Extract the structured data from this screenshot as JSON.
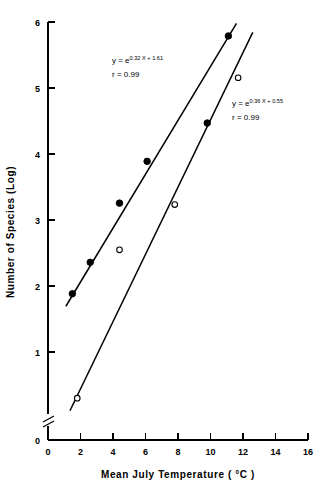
{
  "chart_data": {
    "type": "scatter",
    "title": "",
    "xlabel": "Mean July Temperature ( °C )",
    "ylabel": "Number of Species (Log)",
    "xlim": [
      0,
      16
    ],
    "ylim": [
      0,
      6
    ],
    "x_ticks": [
      0,
      2,
      4,
      6,
      8,
      10,
      12,
      14,
      16
    ],
    "x_tick_labels": [
      "0",
      "2",
      "4",
      "6",
      "8",
      "10",
      "12",
      "14",
      "16"
    ],
    "y_ticks": [
      0,
      1,
      2,
      3,
      4,
      5,
      6
    ],
    "y_tick_labels": [
      "0",
      "1",
      "2",
      "3",
      "4",
      "5",
      "6"
    ],
    "grid": false,
    "legend_position": "none",
    "y_axis_break": {
      "present": true,
      "between": [
        0,
        1
      ],
      "label": "axis-break"
    },
    "series": [
      {
        "name": "filled-circles",
        "marker": "filled-circle",
        "points": [
          {
            "x": 1.5,
            "y": 2.1
          },
          {
            "x": 2.6,
            "y": 2.55
          },
          {
            "x": 4.4,
            "y": 3.4
          },
          {
            "x": 6.1,
            "y": 4.0
          },
          {
            "x": 9.8,
            "y": 4.55
          },
          {
            "x": 11.1,
            "y": 5.8
          }
        ],
        "fit": {
          "equation_html": "y = e",
          "exponent": "0.32 X + 1.61",
          "r_label": "r = 0.99",
          "slope": 0.32,
          "intercept": 1.61,
          "r": 0.99,
          "line_endpoints": [
            {
              "x": 1.1,
              "y": 1.92
            },
            {
              "x": 11.6,
              "y": 5.98
            }
          ]
        }
      },
      {
        "name": "open-circles",
        "marker": "open-circle",
        "points": [
          {
            "x": 1.8,
            "y": 0.6
          },
          {
            "x": 4.4,
            "y": 2.73
          },
          {
            "x": 7.8,
            "y": 3.38
          },
          {
            "x": 11.7,
            "y": 5.2
          }
        ],
        "fit": {
          "equation_html": "y = e",
          "exponent": "0.36 X + 0.55",
          "r_label": "r = 0.99",
          "slope": 0.36,
          "intercept": 0.55,
          "r": 0.99,
          "line_endpoints": [
            {
              "x": 1.35,
              "y": 0.42
            },
            {
              "x": 12.6,
              "y": 5.85
            }
          ]
        }
      }
    ],
    "annotations": [
      {
        "name": "equation-upper",
        "prefix": "y = e",
        "exponent": "0.32 X + 1.61",
        "second_line": "r = 0.99",
        "x_px": 112,
        "y_px": 63
      },
      {
        "name": "equation-lower",
        "prefix": "y = e",
        "exponent": "0.36 X + 0.55",
        "second_line": "r = 0.99",
        "x_px": 232,
        "y_px": 106
      }
    ]
  },
  "axes": {
    "x_title": "Mean July Temperature ( °C )",
    "y_title": "Number of Species (Log)"
  }
}
